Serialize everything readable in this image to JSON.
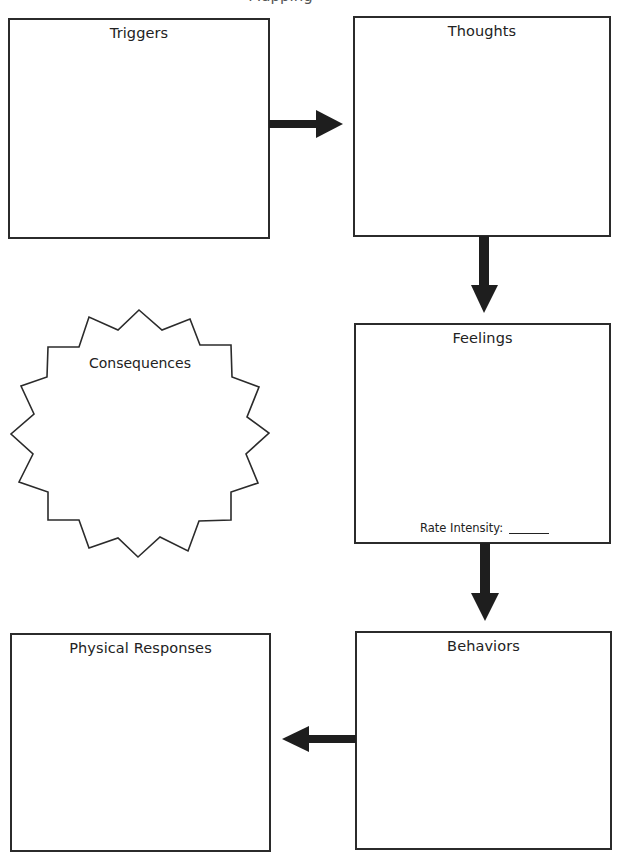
{
  "page": {
    "header_fragment": "Mapping"
  },
  "diagram": {
    "boxes": {
      "triggers": {
        "title": "Triggers"
      },
      "thoughts": {
        "title": "Thoughts"
      },
      "feelings": {
        "title": "Feelings",
        "rate_label": "Rate Intensity:"
      },
      "behaviors": {
        "title": "Behaviors"
      },
      "physical_responses": {
        "title": "Physical Responses"
      }
    },
    "starburst": {
      "title": "Consequences"
    },
    "arrows": [
      {
        "from": "Triggers",
        "to": "Thoughts",
        "direction": "right"
      },
      {
        "from": "Thoughts",
        "to": "Feelings",
        "direction": "down"
      },
      {
        "from": "Feelings",
        "to": "Behaviors",
        "direction": "down"
      },
      {
        "from": "Behaviors",
        "to": "Physical Responses",
        "direction": "left"
      }
    ],
    "colors": {
      "stroke": "#2b2b2b",
      "background": "#ffffff",
      "text": "#222222"
    }
  }
}
